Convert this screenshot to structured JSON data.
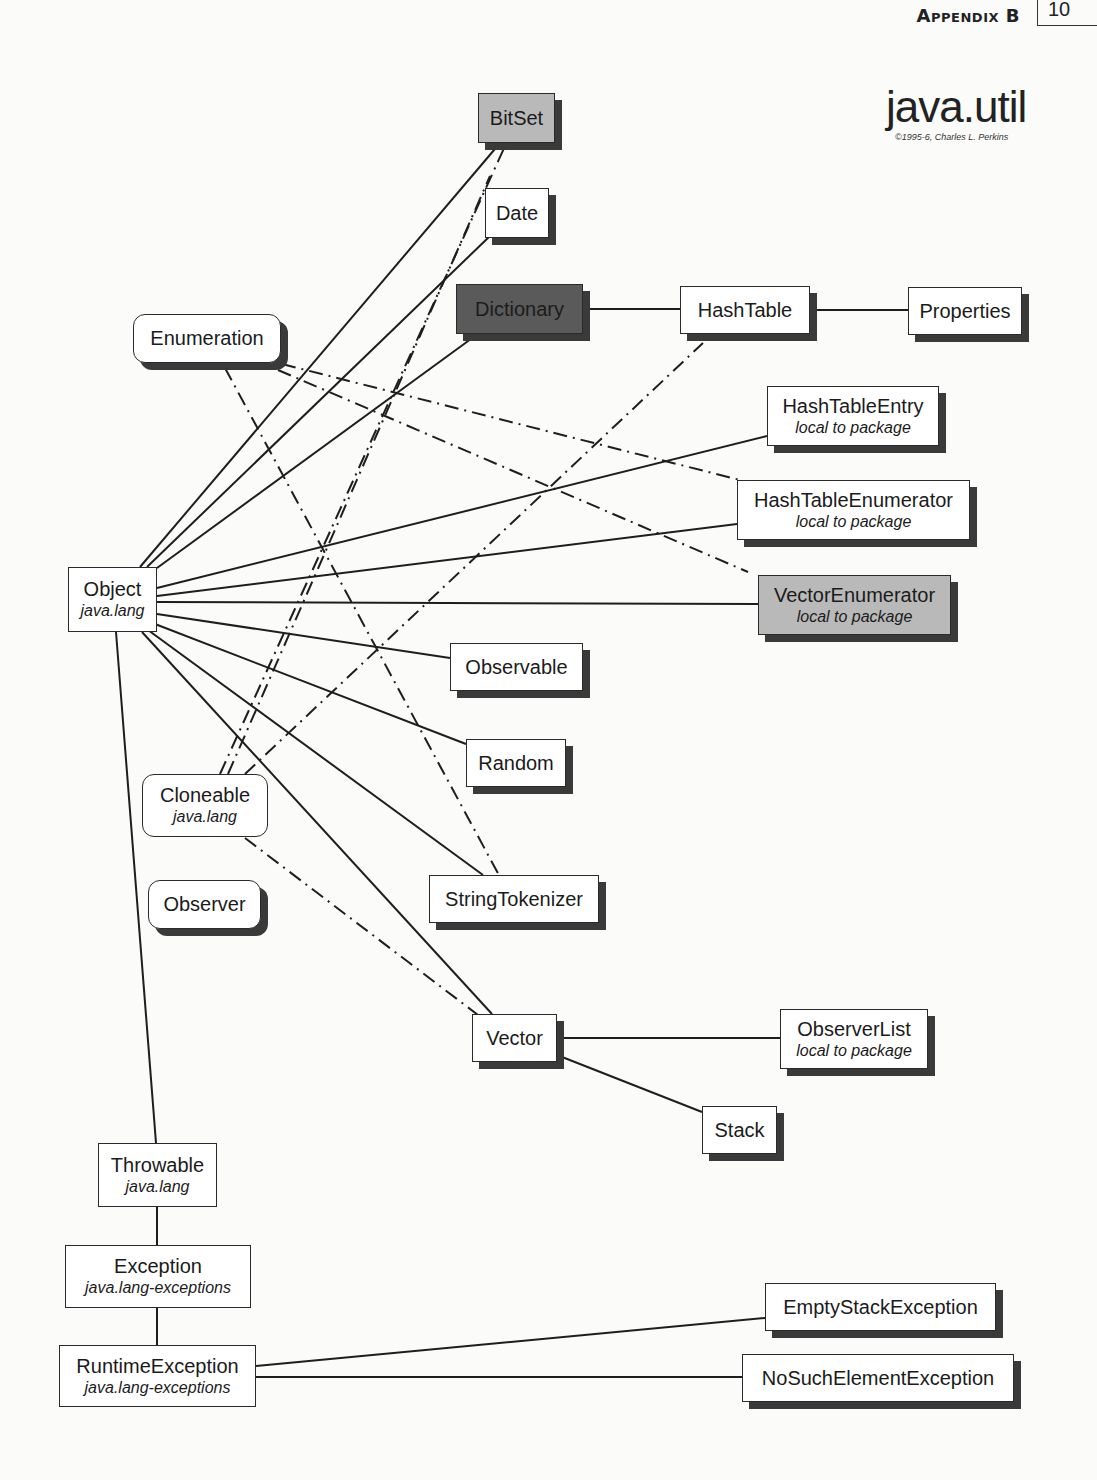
{
  "header": {
    "section_label": "Appendix B",
    "page_number_partial": "10"
  },
  "title": {
    "main": "java.util",
    "copyright": "©1995-6, Charles L. Perkins"
  },
  "colors": {
    "line": "#1e1e1e",
    "shadow": "#3a3a3a",
    "gray_fill": "#b9b9b9",
    "dark_fill": "#5a5a5a",
    "white_fill": "#ffffff"
  },
  "nodes": {
    "bitset": {
      "name": "BitSet",
      "sub": ""
    },
    "date": {
      "name": "Date",
      "sub": ""
    },
    "dictionary": {
      "name": "Dictionary",
      "sub": ""
    },
    "hashtable": {
      "name": "HashTable",
      "sub": ""
    },
    "properties": {
      "name": "Properties",
      "sub": ""
    },
    "enumeration": {
      "name": "Enumeration",
      "sub": ""
    },
    "hashtableentry": {
      "name": "HashTableEntry",
      "sub": "local to package"
    },
    "hashtableenumerator": {
      "name": "HashTableEnumerator",
      "sub": "local to package"
    },
    "vectorenumerator": {
      "name": "VectorEnumerator",
      "sub": "local to package"
    },
    "object": {
      "name": "Object",
      "sub": "java.lang"
    },
    "observable": {
      "name": "Observable",
      "sub": ""
    },
    "random": {
      "name": "Random",
      "sub": ""
    },
    "cloneable": {
      "name": "Cloneable",
      "sub": "java.lang"
    },
    "observer": {
      "name": "Observer",
      "sub": ""
    },
    "stringtokenizer": {
      "name": "StringTokenizer",
      "sub": ""
    },
    "vector": {
      "name": "Vector",
      "sub": ""
    },
    "observerlist": {
      "name": "ObserverList",
      "sub": "local to package"
    },
    "stack": {
      "name": "Stack",
      "sub": ""
    },
    "throwable": {
      "name": "Throwable",
      "sub": "java.lang"
    },
    "exception": {
      "name": "Exception",
      "sub": "java.lang-exceptions"
    },
    "runtimeexception": {
      "name": "RuntimeException",
      "sub": "java.lang-exceptions"
    },
    "emptystackexception": {
      "name": "EmptyStackException",
      "sub": ""
    },
    "nosuchelementexception": {
      "name": "NoSuchElementException",
      "sub": ""
    }
  },
  "edges": {
    "inheritance": [
      [
        "Object",
        "BitSet"
      ],
      [
        "Object",
        "Date"
      ],
      [
        "Object",
        "Dictionary"
      ],
      [
        "Dictionary",
        "HashTable"
      ],
      [
        "HashTable",
        "Properties"
      ],
      [
        "Object",
        "HashTableEntry"
      ],
      [
        "Object",
        "HashTableEnumerator"
      ],
      [
        "Object",
        "VectorEnumerator"
      ],
      [
        "Object",
        "Observable"
      ],
      [
        "Object",
        "Random"
      ],
      [
        "Object",
        "StringTokenizer"
      ],
      [
        "Object",
        "Vector"
      ],
      [
        "Vector",
        "ObserverList"
      ],
      [
        "Vector",
        "Stack"
      ],
      [
        "Object",
        "Throwable"
      ],
      [
        "Throwable",
        "Exception"
      ],
      [
        "Exception",
        "RuntimeException"
      ],
      [
        "RuntimeException",
        "EmptyStackException"
      ],
      [
        "RuntimeException",
        "NoSuchElementException"
      ]
    ],
    "implements": [
      [
        "Enumeration",
        "StringTokenizer"
      ],
      [
        "Enumeration",
        "HashTableEnumerator"
      ],
      [
        "Enumeration",
        "VectorEnumerator"
      ],
      [
        "Cloneable",
        "BitSet"
      ],
      [
        "Cloneable",
        "Date"
      ],
      [
        "Cloneable",
        "HashTable"
      ],
      [
        "Cloneable",
        "Vector"
      ]
    ]
  }
}
